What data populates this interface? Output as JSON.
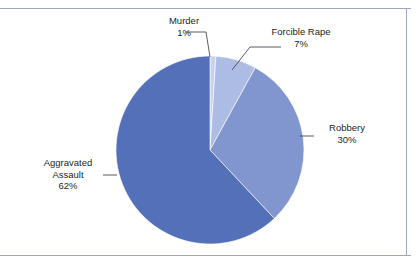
{
  "chart_data": {
    "type": "pie",
    "title": "",
    "subtitle": "",
    "xlabel": "",
    "ylabel": "",
    "legend": "none",
    "grid": false,
    "labels_position": "outside-with-leader-lines",
    "start_angle_deg": 0,
    "direction": "clockwise",
    "categories": [
      "Murder",
      "Forcible Rape",
      "Robbery",
      "Aggravated Assault"
    ],
    "values": [
      1,
      7,
      30,
      62
    ],
    "value_suffix": "%",
    "colors": [
      "#c8d2ec",
      "#adbce5",
      "#8195ce",
      "#5470b8"
    ],
    "slices": [
      {
        "label": "Murder",
        "value": 1,
        "value_text": "1%",
        "color": "#c8d2ec"
      },
      {
        "label": "Forcible Rape",
        "value": 7,
        "value_text": "7%",
        "color": "#adbce5"
      },
      {
        "label": "Robbery",
        "value": 30,
        "value_text": "30%",
        "color": "#8195ce"
      },
      {
        "label": "Aggravated Assault",
        "value": 62,
        "value_text": "62%",
        "color": "#5470b8"
      }
    ]
  },
  "labels": {
    "murder": {
      "name": "Murder",
      "value": "1%"
    },
    "forcible_rape": {
      "name": "Forcible Rape",
      "value": "7%"
    },
    "robbery": {
      "name": "Robbery",
      "value": "30%"
    },
    "aggravated_assault_line1": "Aggravated",
    "aggravated_assault_line2": "Assault",
    "aggravated_assault_value": "62%"
  },
  "style": {
    "background": "#ffffff",
    "frame_rule_color": "#9fa6c0",
    "text_color": "#231f20",
    "leader_line_color": "#4a4a52",
    "slice_outline_color": "#ffffff"
  }
}
